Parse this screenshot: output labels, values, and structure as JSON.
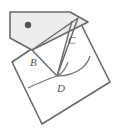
{
  "figure": {
    "kind": "geometry-diagram",
    "canvas": {
      "width": 126,
      "height": 135
    },
    "colors": {
      "stroke": "#6b6b6b",
      "stroke_dark": "#4a4a4a",
      "flap_fill": "#ededed",
      "sheet_fill": "#ffffff",
      "dot_fill": "#555555",
      "label_color": "#555555",
      "background": "#ffffff"
    },
    "labels": [
      {
        "id": "label-B",
        "text": "B",
        "x": 30,
        "y": 66
      },
      {
        "id": "label-C",
        "text": "C",
        "x": 68,
        "y": 44
      },
      {
        "id": "label-D",
        "text": "D",
        "x": 57,
        "y": 92
      }
    ],
    "points": {
      "B": {
        "x": 32,
        "y": 50
      },
      "C": {
        "x": 78,
        "y": 18
      },
      "D": {
        "x": 57,
        "y": 76
      }
    },
    "shapes": {
      "sheet_points": "12,62 78,18 110,82 42,124",
      "flap_points": "10,12 70,12 88,22 32,50 10,38",
      "dot": {
        "cx": 28,
        "cy": 25,
        "r": 3.2
      }
    },
    "fold_lines": [
      {
        "id": "fold-B-C",
        "x1": 32,
        "y1": 50,
        "x2": 78,
        "y2": 18
      },
      {
        "id": "fold-B-D",
        "x1": 32,
        "y1": 50,
        "x2": 57,
        "y2": 76
      },
      {
        "id": "fold-C-D",
        "x1": 78,
        "y1": 18,
        "x2": 57,
        "y2": 76
      },
      {
        "id": "fold-C-down",
        "x1": 72,
        "y1": 22,
        "x2": 57,
        "y2": 76
      }
    ],
    "arcs": [
      {
        "id": "arc-lower-left",
        "d": "M 28,88 Q 45,80 57,76 Q 64,73 68,62"
      },
      {
        "id": "arc-right",
        "d": "M 57,76 Q 72,76 82,68 Q 88,63 90,56"
      }
    ]
  }
}
